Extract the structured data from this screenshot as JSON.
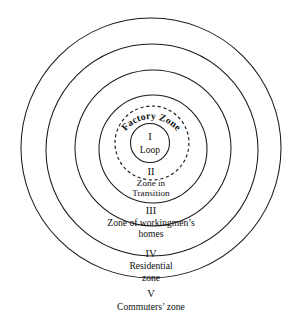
{
  "diagram": {
    "background_color": "#ffffff",
    "line_color": "#1a1a1a",
    "text_color": "#111111",
    "center": {
      "x": 151,
      "y": 148
    },
    "curved_label": "Factory Zone",
    "zones": [
      {
        "numeral": "I",
        "name": "Loop",
        "radius": 20,
        "style": "solid"
      },
      {
        "numeral": "",
        "name": "Factory Zone",
        "radius": 37,
        "style": "dashed"
      },
      {
        "numeral": "II",
        "name_line1": "Zone in",
        "name_line2": "Transition",
        "radius": 54,
        "style": "solid"
      },
      {
        "numeral": "III",
        "name_line1": "Zone of workingmen’s",
        "name_line2": "homes",
        "radius": 78,
        "style": "solid"
      },
      {
        "numeral": "IV",
        "name_line1": "Residential",
        "name_line2": "zone",
        "radius": 106,
        "style": "solid"
      },
      {
        "numeral": "V",
        "name_line1": "Commuters’ zone",
        "name_line2": "",
        "radius": 130,
        "style": "solid"
      }
    ],
    "labels": {
      "zone1_numeral": "I",
      "zone1_name": "Loop",
      "factory_zone": "Factory Zone",
      "zone2_numeral": "II",
      "zone2_line1": "Zone in",
      "zone2_line2": "Transition",
      "zone3_numeral": "III",
      "zone3_line1": "Zone of workingmen’s",
      "zone3_line2": "homes",
      "zone4_numeral": "IV",
      "zone4_line1": "Residential",
      "zone4_line2": "zone",
      "zone5_numeral": "V",
      "zone5_line1": "Commuters’ zone"
    }
  }
}
